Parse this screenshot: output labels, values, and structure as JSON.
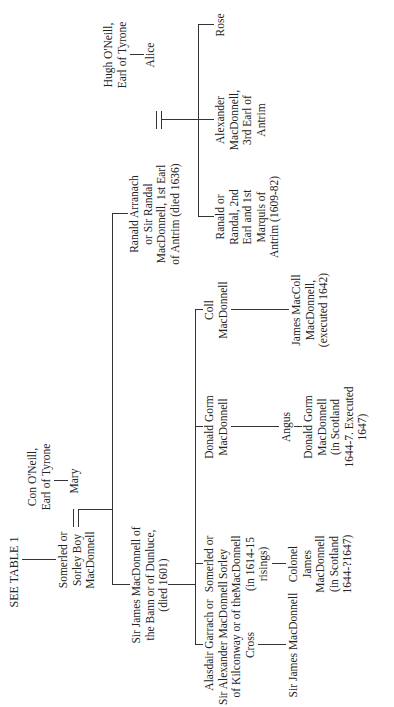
{
  "tree": {
    "header": "SEE TABLE 1",
    "root": {
      "name_lines": [
        "Somerled or",
        "Sorley Boy",
        "MacDonnell"
      ],
      "spouse": {
        "father_lines": [
          "Con O'Neill,",
          "Earl of Tyrone"
        ],
        "name": "Mary"
      }
    },
    "children": [
      {
        "id": "sir-james-dunluce",
        "name_lines": [
          "Sir James MacDonnell of",
          "the Bann or of Dunluce,",
          "(died 1601)"
        ],
        "children": [
          {
            "id": "alasdair",
            "name_lines": [
              "Alasdair Garrach or",
              "Sir Alexander MacDonnell",
              "of Kilconway or of the",
              "Cross"
            ],
            "children": [
              {
                "name_lines": [
                  "Sir James MacDonnell"
                ]
              }
            ]
          },
          {
            "id": "somerled-sorley",
            "name_lines": [
              "Somerled or",
              "Sorley",
              "MacDonnell",
              "(in 1614-15",
              "risings)"
            ],
            "children": [
              {
                "name_lines": [
                  "Colonel",
                  "James",
                  "MacDonnell",
                  "(in Scotland",
                  "1644-?1647)"
                ]
              }
            ]
          },
          {
            "id": "donald-gorm",
            "name_lines": [
              "Donald Gorm",
              "MacDonnell"
            ],
            "children": [
              {
                "name_lines": [
                  "Angus"
                ],
                "children": [
                  {
                    "name_lines": [
                      "Donald Gorm",
                      "MacDonnell",
                      "(in Scotland",
                      "1644-7. Executed",
                      "1647)"
                    ]
                  }
                ]
              }
            ]
          },
          {
            "id": "coll",
            "name_lines": [
              "Coll",
              "MacDonnell"
            ],
            "children": [
              {
                "name_lines": [
                  "James MacColl",
                  "MacDonnell,",
                  "(executed 1642)"
                ]
              }
            ]
          }
        ]
      },
      {
        "id": "ranald-1st-earl",
        "name_lines": [
          "Ranald Arranach",
          "or Sir Randal",
          "MacDonnell, 1st Earl",
          "of Antrim (died 1636)"
        ],
        "spouse": {
          "father_lines": [
            "Hugh O'Neill,",
            "Earl of Tyrone"
          ],
          "name": "Alice"
        },
        "children": [
          {
            "name_lines": [
              "Ranald or",
              "Randal, 2nd",
              "Earl and 1st",
              "Marquis of",
              "Antrim (1609-82)"
            ]
          },
          {
            "name_lines": [
              "Alexander",
              "MacDonnell,",
              "3rd Earl of",
              "Antrim"
            ]
          },
          {
            "name_lines": [
              "Rose"
            ]
          }
        ]
      }
    ]
  }
}
